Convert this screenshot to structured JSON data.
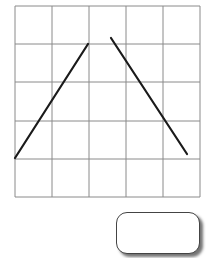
{
  "diagram": {
    "type": "grid-with-line-segments",
    "grid": {
      "columns": 5,
      "rows": 5,
      "x_lines": [
        15,
        52,
        89,
        126,
        163,
        200
      ],
      "y_lines": [
        6,
        44,
        82,
        121,
        159,
        197
      ],
      "line_color": "#8a8a8a"
    },
    "segments": [
      {
        "name": "left-segment",
        "x1": 15,
        "y1": 158,
        "x2": 88,
        "y2": 44,
        "color": "#1a1a1a"
      },
      {
        "name": "right-segment",
        "x1": 111,
        "y1": 38,
        "x2": 187,
        "y2": 154,
        "color": "#1a1a1a"
      }
    ]
  },
  "answer_box": {
    "value": ""
  }
}
